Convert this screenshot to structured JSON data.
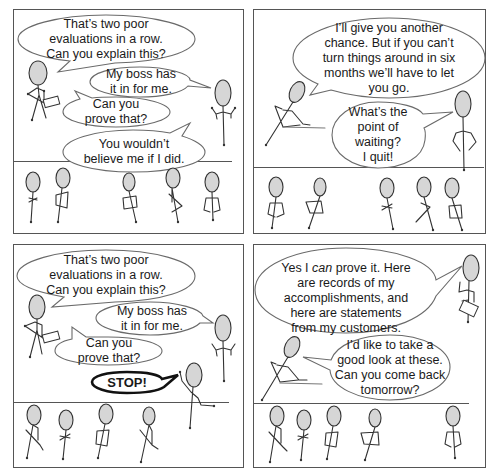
{
  "comic": {
    "colors": {
      "panel_border": "#555555",
      "bubble_outline": "#6a6a6a",
      "head_fill": "#d6d6d6",
      "line": "#333333",
      "stop_outline": "#111111"
    },
    "panels": [
      {
        "id": "top-left",
        "bubbles": [
          {
            "speaker": "manager",
            "text": "That’s two poor\nevaluations in a row.\nCan you explain this?"
          },
          {
            "speaker": "employee",
            "text": "My boss has\nit in for me."
          },
          {
            "speaker": "manager",
            "text": "Can you\nprove that?"
          },
          {
            "speaker": "employee",
            "text": "You wouldn’t\nbelieve me if I did."
          }
        ]
      },
      {
        "id": "top-right",
        "bubbles": [
          {
            "speaker": "manager",
            "text": "I’ll give you another\nchance. But if you can’t\nturn things around in six\nmonths we’ll have to let\nyou go."
          },
          {
            "speaker": "employee",
            "text": "What’s the\npoint of\nwaiting?\nI quit!"
          }
        ]
      },
      {
        "id": "bottom-left",
        "bubbles": [
          {
            "speaker": "manager",
            "text": "That’s two poor\nevaluations in a row.\nCan you explain this?"
          },
          {
            "speaker": "employee",
            "text": "My boss has\nit in for me."
          },
          {
            "speaker": "manager",
            "text": "Can you\nprove that?"
          },
          {
            "speaker": "interrupter",
            "text": "STOP!"
          }
        ]
      },
      {
        "id": "bottom-right",
        "bubbles": [
          {
            "speaker": "employee",
            "text_before": "Yes I ",
            "text_em": "can",
            "text_after": " prove it. Here\nare records of my\naccomplishments, and\nhere are statements\nfrom my customers."
          },
          {
            "speaker": "manager",
            "text": "I’d like to take a\ngood look at these.\nCan you come back\ntomorrow?"
          }
        ]
      }
    ]
  }
}
